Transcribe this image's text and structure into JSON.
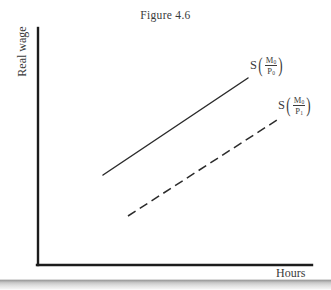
{
  "figure": {
    "title": "Figure 4.6",
    "background_color": "#ffffff",
    "ink_color": "#2b2b2b"
  },
  "axes": {
    "y_label": "Real wage",
    "x_label": "Hours",
    "origin": {
      "x": 38,
      "y": 265
    },
    "y_top": 28,
    "x_right": 312,
    "line_width": 2.4,
    "color": "#1c1c1c"
  },
  "curves": [
    {
      "id": "supply-solid",
      "style": "solid",
      "color": "#2b2b2b",
      "width": 1.5,
      "x1": 103,
      "y1": 175,
      "x2": 248,
      "y2": 78,
      "label": {
        "s": "S",
        "numerator": "M",
        "numerator_sub": "0",
        "denominator": "P",
        "denominator_sub": "0",
        "text": "S(M0/P0)"
      }
    },
    {
      "id": "supply-dashed",
      "style": "dashed",
      "color": "#2b2b2b",
      "width": 1.5,
      "dash_pattern": "9 5",
      "x1": 128,
      "y1": 216,
      "x2": 277,
      "y2": 120,
      "label": {
        "s": "S",
        "numerator": "M",
        "numerator_sub": "0",
        "denominator": "P",
        "denominator_sub": "1",
        "text": "S(M0/P1)"
      }
    }
  ],
  "chart_data": {
    "type": "line",
    "title": "Figure 4.6",
    "xlabel": "Hours",
    "ylabel": "Real wage",
    "grid": false,
    "legend_position": "inline-right",
    "axis_ticks": [],
    "annotations": [
      "S(M0/P0)",
      "S(M0/P1)"
    ],
    "series": [
      {
        "name": "S(M0/P0)",
        "style": "solid",
        "x": [
          0.24,
          0.77
        ],
        "y": [
          0.38,
          0.79
        ]
      },
      {
        "name": "S(M0/P1)",
        "style": "dashed",
        "x": [
          0.33,
          0.87
        ],
        "y": [
          0.21,
          0.61
        ]
      }
    ],
    "xlim": [
      0,
      1
    ],
    "ylim": [
      0,
      1
    ]
  }
}
